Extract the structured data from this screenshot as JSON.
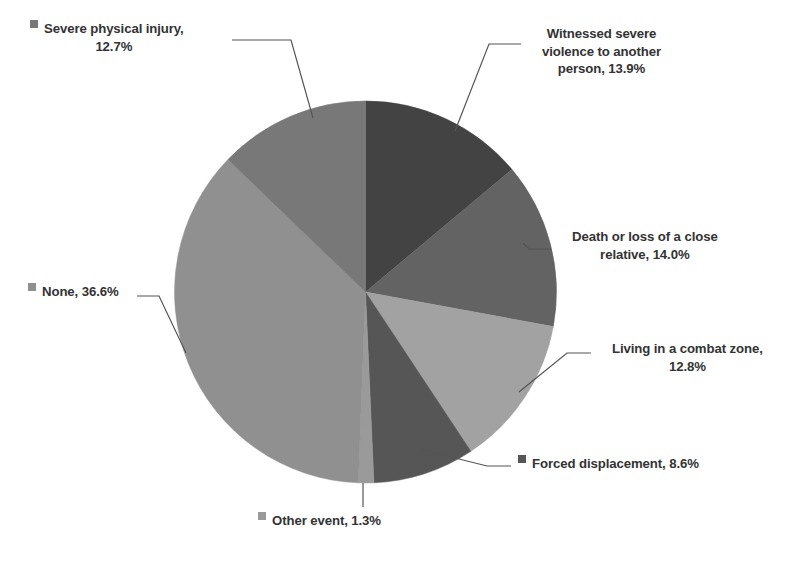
{
  "chart_data": {
    "type": "pie",
    "title": "",
    "subtitle": "",
    "xlabel": "",
    "ylabel": "",
    "legend_position": "callout-labels",
    "grid": false,
    "units": "percent",
    "categories": [
      "Witnessed severe violence to another person",
      "Death or loss of a close relative",
      "Living in a combat zone",
      "Forced displacement",
      "Other event",
      "None",
      "Severe physical injury"
    ],
    "values": [
      13.9,
      14.0,
      12.8,
      8.6,
      1.3,
      36.6,
      12.7
    ],
    "colors": [
      "#434343",
      "#636363",
      "#a2a2a2",
      "#565656",
      "#9a9a9a",
      "#909090",
      "#787878"
    ],
    "slices": [
      {
        "label": "Witnessed severe violence to another person",
        "value": 13.9,
        "display": "13.9%",
        "color": "#434343",
        "start_angle": 0,
        "end_angle": 50.04
      },
      {
        "label": "Death or loss of a close relative",
        "value": 14.0,
        "display": "14.0%",
        "color": "#636363",
        "start_angle": 50.04,
        "end_angle": 100.44
      },
      {
        "label": "Living in a combat zone",
        "value": 12.8,
        "display": "12.8%",
        "color": "#a2a2a2",
        "start_angle": 100.44,
        "end_angle": 146.52
      },
      {
        "label": "Forced displacement",
        "value": 8.6,
        "display": "8.6%",
        "color": "#565656",
        "start_angle": 146.52,
        "end_angle": 177.48
      },
      {
        "label": "Other event",
        "value": 1.3,
        "display": "1.3%",
        "color": "#9a9a9a",
        "start_angle": 177.48,
        "end_angle": 182.16
      },
      {
        "label": "None",
        "value": 36.6,
        "display": "36.6%",
        "color": "#909090",
        "start_angle": 182.16,
        "end_angle": 313.92
      },
      {
        "label": "Severe physical injury",
        "value": 12.7,
        "display": "12.7%",
        "color": "#787878",
        "start_angle": 313.92,
        "end_angle": 360
      }
    ]
  },
  "callouts": {
    "severe_physical_injury": "Severe physical injury,\n12.7%",
    "witnessed_severe_violence": "Witnessed severe\nviolence to another\nperson,  13.9%",
    "death_or_loss": "Death or loss of a close\nrelative, 14.0%",
    "living_combat_zone": "Living in a combat zone,\n12.8%",
    "forced_displacement": "Forced displacement, 8.6%",
    "other_event": "Other event,  1.3%",
    "none": "None,  36.6%"
  },
  "style": {
    "background": "#ffffff",
    "text_color": "#333333",
    "leader_line_color": "#555555"
  }
}
